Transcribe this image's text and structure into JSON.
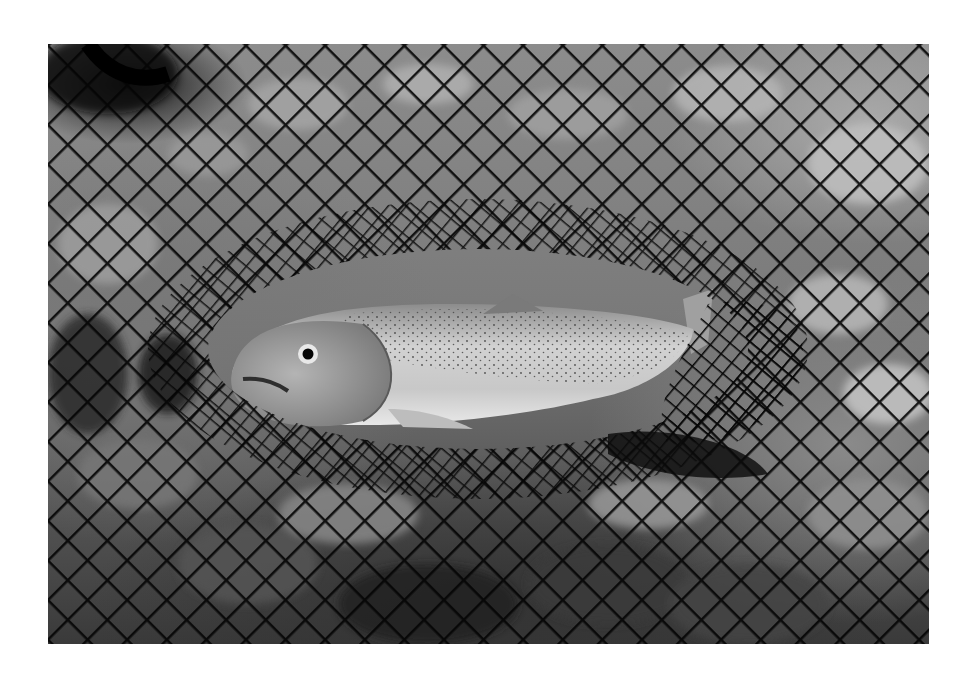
{
  "image": {
    "subject": "trout-in-landing-net",
    "description": "Black-and-white photograph of a spotted trout lying inside a dark mesh landing net over a rocky streambed",
    "colors": {
      "background": "#ffffff",
      "net": "#0a0a0a",
      "fish_body": "#cfcfcf",
      "fish_head": "#9a9a9a",
      "water": "#7d7d7d"
    }
  }
}
